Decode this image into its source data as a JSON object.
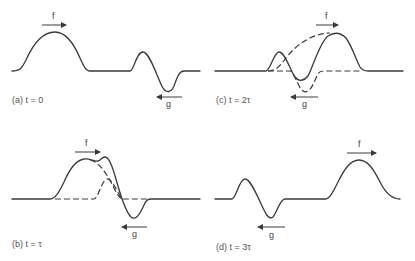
{
  "figure": {
    "panels": [
      {
        "id": "a",
        "caption": "(a) t = 0",
        "f_label": "f",
        "g_label": "g"
      },
      {
        "id": "b",
        "caption": "(b) t = τ",
        "f_label": "f",
        "g_label": "g"
      },
      {
        "id": "c",
        "caption": "(c) t = 2τ",
        "f_label": "f",
        "g_label": "g"
      },
      {
        "id": "d",
        "caption": "(d) t = 3τ",
        "f_label": "f",
        "g_label": "g"
      }
    ],
    "legend": {
      "solid": "superposition (total displacement)",
      "dashed": "individual pulses f and g"
    },
    "colors": {
      "line": "#3a3a3a",
      "text": "#555555",
      "background": "#ffffff"
    }
  }
}
